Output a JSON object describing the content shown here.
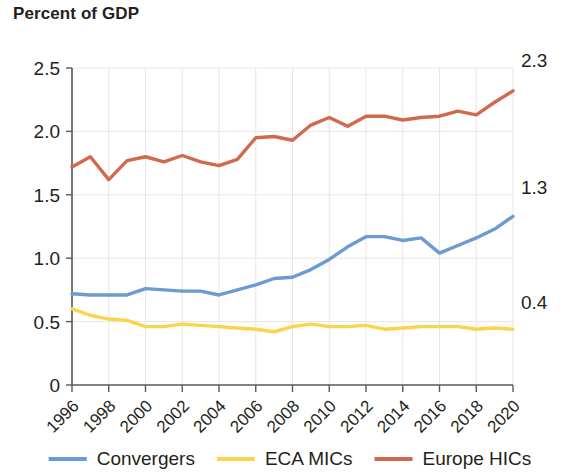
{
  "title": "Percent of GDP",
  "colors": {
    "convergers": "#6b9bd2",
    "eca_mics": "#fad44b",
    "europe_hics": "#d1694f",
    "axis": "#58595b",
    "grid": "#e9e6e2",
    "text": "#231f20"
  },
  "axes": {
    "y_ticks": [
      "0",
      "0.5",
      "1.0",
      "1.5",
      "2.0",
      "2.5"
    ],
    "x_ticks": [
      "1996",
      "1998",
      "2000",
      "2002",
      "2004",
      "2006",
      "2008",
      "2010",
      "2012",
      "2014",
      "2016",
      "2018",
      "2020"
    ]
  },
  "end_labels": {
    "europe_hics": "2.3",
    "convergers": "1.3",
    "eca_mics": "0.4"
  },
  "legend": {
    "items": [
      {
        "label": "Convergers",
        "color": "#6b9bd2"
      },
      {
        "label": "ECA MICs",
        "color": "#fad44b"
      },
      {
        "label": "Europe HICs",
        "color": "#d1694f"
      }
    ]
  },
  "chart_data": {
    "type": "line",
    "title": "Percent of GDP",
    "xlabel": "",
    "ylabel": "Percent of GDP",
    "xlim": [
      1996,
      2020
    ],
    "ylim": [
      0,
      2.5
    ],
    "grid": true,
    "legend_position": "bottom",
    "x": [
      1996,
      1997,
      1998,
      1999,
      2000,
      2001,
      2002,
      2003,
      2004,
      2005,
      2006,
      2007,
      2008,
      2009,
      2010,
      2011,
      2012,
      2013,
      2014,
      2015,
      2016,
      2017,
      2018,
      2019,
      2020
    ],
    "x_tick_labels": [
      "1996",
      "1998",
      "2000",
      "2002",
      "2004",
      "2006",
      "2008",
      "2010",
      "2012",
      "2014",
      "2016",
      "2018",
      "2020"
    ],
    "y_tick_labels": [
      "0",
      "0.5",
      "1.0",
      "1.5",
      "2.0",
      "2.5"
    ],
    "series": [
      {
        "name": "Convergers",
        "color": "#6b9bd2",
        "end_label": "1.3",
        "values": [
          0.72,
          0.71,
          0.71,
          0.71,
          0.76,
          0.75,
          0.74,
          0.74,
          0.71,
          0.75,
          0.79,
          0.84,
          0.85,
          0.91,
          0.99,
          1.09,
          1.17,
          1.17,
          1.14,
          1.16,
          1.04,
          1.1,
          1.16,
          1.23,
          1.33
        ]
      },
      {
        "name": "ECA MICs",
        "color": "#fad44b",
        "end_label": "0.4",
        "values": [
          0.6,
          0.55,
          0.52,
          0.51,
          0.46,
          0.46,
          0.48,
          0.47,
          0.46,
          0.45,
          0.44,
          0.42,
          0.46,
          0.48,
          0.46,
          0.46,
          0.47,
          0.44,
          0.45,
          0.46,
          0.46,
          0.46,
          0.44,
          0.45,
          0.44
        ]
      },
      {
        "name": "Europe HICs",
        "color": "#d1694f",
        "end_label": "2.3",
        "values": [
          1.72,
          1.8,
          1.62,
          1.77,
          1.8,
          1.76,
          1.81,
          1.76,
          1.73,
          1.78,
          1.95,
          1.96,
          1.93,
          2.05,
          2.11,
          2.04,
          2.12,
          2.12,
          2.09,
          2.11,
          2.12,
          2.16,
          2.13,
          2.23,
          2.32
        ]
      }
    ]
  }
}
